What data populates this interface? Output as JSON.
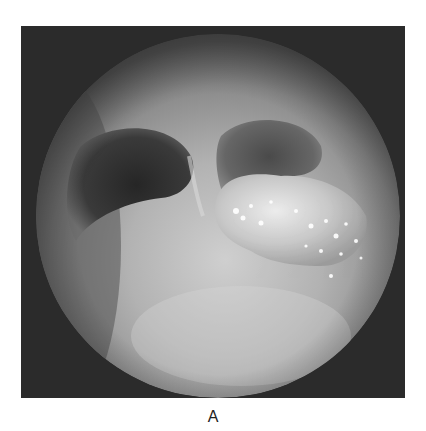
{
  "figure": {
    "panel_label": "A",
    "image": {
      "subject": "endoscopic bronchoscopy view",
      "colors": {
        "frame_background": "#2b2b2b",
        "mucosa_light": "#c9c9c9",
        "mucosa_mid": "#9a9a9a",
        "lumen_dark": "#3a3a3a",
        "lesion": "#dedede"
      }
    }
  }
}
